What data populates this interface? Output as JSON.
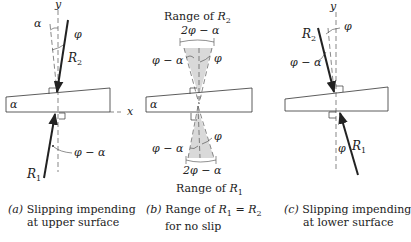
{
  "figure": {
    "panels": [
      {
        "id": "a",
        "labels": {
          "y_axis": "y",
          "x_axis": "x",
          "alpha_top": "α",
          "phi_top": "φ",
          "R2": "R",
          "R2_sub": "2",
          "wedge_alpha": "α",
          "phi_minus_alpha": "φ − α",
          "R1": "R",
          "R1_sub": "1"
        },
        "caption": {
          "tag": "(a)",
          "line1": "Slipping impending",
          "line2": "at upper surface"
        }
      },
      {
        "id": "b",
        "labels": {
          "range_top_prefix": "Range of ",
          "range_top_var": "R",
          "range_top_sub": "2",
          "two_phi_minus_alpha_top": "2φ − α",
          "phi_minus_alpha_top": "φ − α",
          "phi_top": "φ",
          "wedge_alpha": "α",
          "phi_minus_alpha_bottom": "φ − α",
          "phi_bottom": "φ",
          "two_phi_minus_alpha_bottom": "2φ − α",
          "range_bottom_prefix": "Range of ",
          "range_bottom_var": "R",
          "range_bottom_sub": "1"
        },
        "caption": {
          "tag": "(b)",
          "line1_prefix": "Range of ",
          "line1_math": "R",
          "line1_sub1": "1",
          "line1_eq": " = ",
          "line1_math2": "R",
          "line1_sub2": "2",
          "line2": "for no slip"
        }
      },
      {
        "id": "c",
        "labels": {
          "y_axis": "y",
          "phi_top": "φ",
          "R2": "R",
          "R2_sub": "2",
          "phi_minus_alpha": "φ − α",
          "phi_bottom": "φ",
          "R1": "R",
          "R1_sub": "1"
        },
        "caption": {
          "tag": "(c)",
          "line1": "Slipping impending",
          "line2": "at lower surface"
        }
      }
    ],
    "colors": {
      "line": "#222222",
      "shade": "#d9d9d9",
      "dash": "#555555"
    }
  }
}
